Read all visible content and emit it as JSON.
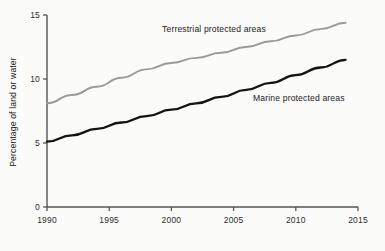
{
  "chart_data": {
    "type": "line",
    "title": "",
    "xlabel": "",
    "ylabel": "Percentage of land or water",
    "xlim": [
      1990,
      2015
    ],
    "ylim": [
      0,
      15
    ],
    "xticks": [
      1990,
      1995,
      2000,
      2005,
      2010,
      2015
    ],
    "xtick_labels": [
      "1990",
      "1995",
      "2000",
      "2005",
      "2010",
      "2015"
    ],
    "yticks": [
      0,
      5,
      10,
      15
    ],
    "ytick_labels": [
      "0",
      "5",
      "10",
      "15"
    ],
    "grid": false,
    "legend_position": "inline-annotations",
    "series": [
      {
        "name": "Terrestrial protected areas",
        "color": "#9a9a9a",
        "label_x": 1995.8,
        "label_y": 13.6,
        "x": [
          1990,
          1992,
          1994,
          1996,
          1998,
          2000,
          2002,
          2004,
          2006,
          2008,
          2010,
          2012,
          2014
        ],
        "values": [
          8.1,
          8.75,
          9.4,
          10.1,
          10.75,
          11.25,
          11.65,
          12.05,
          12.5,
          12.95,
          13.4,
          13.9,
          14.4
        ]
      },
      {
        "name": "Marine protected areas",
        "color": "#141414",
        "label_x": 2006.6,
        "label_y": 9.0,
        "x": [
          1990,
          1992,
          1994,
          1996,
          1998,
          2000,
          2002,
          2004,
          2006,
          2008,
          2010,
          2012,
          2014
        ],
        "values": [
          5.1,
          5.6,
          6.1,
          6.6,
          7.1,
          7.6,
          8.1,
          8.6,
          9.15,
          9.7,
          10.3,
          10.9,
          11.5
        ]
      }
    ],
    "axis_color": "#555555",
    "background_color": "#fbfbfa"
  }
}
